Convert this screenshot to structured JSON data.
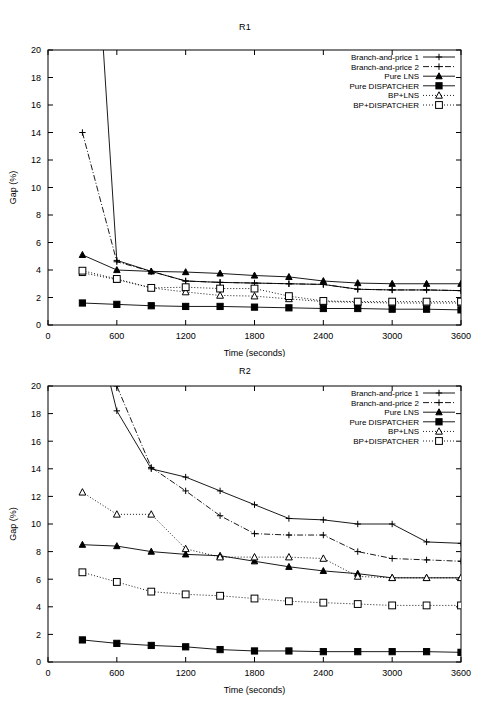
{
  "figure": {
    "width": 490,
    "height": 714,
    "background": "#ffffff",
    "foreground": "#000000"
  },
  "chart_data": [
    {
      "type": "line",
      "title": "R1",
      "xlabel": "Time (seconds)",
      "ylabel": "Gap (%)",
      "xlim": [
        0,
        3600
      ],
      "ylim": [
        0,
        20
      ],
      "xticks": [
        0,
        600,
        1200,
        1800,
        2400,
        3000,
        3600
      ],
      "yticks": [
        0,
        2,
        4,
        6,
        8,
        10,
        12,
        14,
        16,
        18,
        20
      ],
      "grid": false,
      "legend_position": "top-right",
      "x": [
        300,
        600,
        900,
        1200,
        1500,
        1800,
        2100,
        2400,
        2700,
        3000,
        3300,
        3600
      ],
      "series": [
        {
          "name": "Branch-and-price 1",
          "marker": "plus",
          "dash": "solid",
          "values": [
            null,
            4.7,
            3.9,
            3.2,
            3.1,
            3.05,
            3.0,
            2.95,
            2.6,
            2.55,
            2.55,
            2.5
          ]
        },
        {
          "name": "Branch-and-price 2",
          "marker": "plus",
          "dash": "dashdot",
          "values": [
            14.0,
            4.6,
            3.9,
            3.2,
            3.1,
            3.05,
            3.0,
            2.95,
            2.6,
            2.55,
            2.55,
            2.5
          ]
        },
        {
          "name": "Pure LNS",
          "marker": "triangle-filled",
          "dash": "solid",
          "values": [
            5.1,
            4.0,
            3.9,
            3.85,
            3.75,
            3.6,
            3.5,
            3.2,
            3.05,
            3.0,
            3.0,
            3.0
          ]
        },
        {
          "name": "Pure DISPATCHER",
          "marker": "square-filled",
          "dash": "solid",
          "values": [
            1.6,
            1.5,
            1.4,
            1.35,
            1.35,
            1.3,
            1.25,
            1.2,
            1.2,
            1.15,
            1.15,
            1.1
          ]
        },
        {
          "name": "BP+LNS",
          "marker": "triangle-open",
          "dash": "dotted",
          "values": [
            3.8,
            3.3,
            2.7,
            2.4,
            2.15,
            2.1,
            1.9,
            1.7,
            1.65,
            1.6,
            1.6,
            1.6
          ]
        },
        {
          "name": "BP+DISPATCHER",
          "marker": "square-open",
          "dash": "dotted",
          "values": [
            3.95,
            3.35,
            2.7,
            2.75,
            2.65,
            2.65,
            2.1,
            1.75,
            1.7,
            1.7,
            1.7,
            1.7
          ]
        }
      ]
    },
    {
      "type": "line",
      "title": "R2",
      "xlabel": "Time (seconds)",
      "ylabel": "Gap (%)",
      "xlim": [
        0,
        3600
      ],
      "ylim": [
        0,
        20
      ],
      "xticks": [
        0,
        600,
        1200,
        1800,
        2400,
        3000,
        3600
      ],
      "yticks": [
        0,
        2,
        4,
        6,
        8,
        10,
        12,
        14,
        16,
        18,
        20
      ],
      "grid": false,
      "legend_position": "top-right",
      "x": [
        300,
        600,
        900,
        1200,
        1500,
        1800,
        2100,
        2400,
        2700,
        3000,
        3300,
        3600
      ],
      "series": [
        {
          "name": "Branch-and-price 1",
          "marker": "plus",
          "dash": "solid",
          "values": [
            null,
            18.2,
            14.0,
            13.4,
            12.4,
            11.4,
            10.4,
            10.3,
            10.0,
            10.0,
            8.7,
            8.6
          ]
        },
        {
          "name": "Branch-and-price 2",
          "marker": "plus",
          "dash": "dashdot",
          "values": [
            null,
            20.0,
            14.1,
            12.4,
            10.6,
            9.3,
            9.2,
            9.2,
            8.0,
            7.5,
            7.4,
            7.3
          ]
        },
        {
          "name": "Pure LNS",
          "marker": "triangle-filled",
          "dash": "solid",
          "values": [
            8.5,
            8.4,
            8.0,
            7.8,
            7.7,
            7.3,
            6.9,
            6.6,
            6.4,
            6.1,
            6.1,
            6.1
          ]
        },
        {
          "name": "Pure DISPATCHER",
          "marker": "square-filled",
          "dash": "solid",
          "values": [
            1.6,
            1.35,
            1.2,
            1.1,
            0.9,
            0.8,
            0.8,
            0.75,
            0.75,
            0.75,
            0.75,
            0.7
          ]
        },
        {
          "name": "BP+LNS",
          "marker": "triangle-open",
          "dash": "dotted",
          "values": [
            12.3,
            10.7,
            10.7,
            8.2,
            7.6,
            7.6,
            7.6,
            7.5,
            6.2,
            6.1,
            6.1,
            6.1
          ]
        },
        {
          "name": "BP+DISPATCHER",
          "marker": "square-open",
          "dash": "dotted",
          "values": [
            6.5,
            5.8,
            5.1,
            4.9,
            4.8,
            4.6,
            4.4,
            4.3,
            4.2,
            4.1,
            4.1,
            4.1
          ]
        }
      ]
    }
  ]
}
